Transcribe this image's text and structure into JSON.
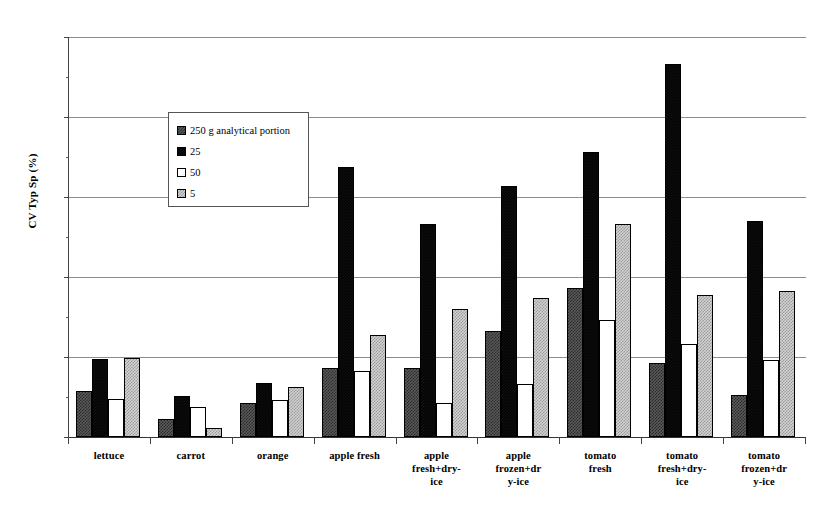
{
  "chart_data": {
    "type": "bar",
    "title": "",
    "subtitle": "",
    "xlabel": "",
    "ylabel": "CV Typ Sp (%)",
    "ylim": [
      0,
      25
    ],
    "ytick_labels": [
      "0",
      "5",
      "10",
      "15",
      "20",
      "25"
    ],
    "ytick_values": [
      0,
      5,
      10,
      15,
      20,
      25
    ],
    "grid": true,
    "legend_position": "upper-left-inside",
    "categories": [
      "lettuce",
      "carrot",
      "orange",
      "apple fresh",
      "apple fresh+dry-ice",
      "apple frozen+dry-ice",
      "tomato fresh",
      "tomato fresh+dry-ice",
      "tomato frozen+dry-ice"
    ],
    "category_label_lines": [
      [
        "lettuce"
      ],
      [
        "carrot"
      ],
      [
        "orange"
      ],
      [
        "apple fresh"
      ],
      [
        "apple",
        "fresh+dry-",
        "ice"
      ],
      [
        "apple",
        "frozen+dr",
        "y-ice"
      ],
      [
        "tomato",
        "fresh"
      ],
      [
        "tomato",
        "fresh+dry-",
        "ice"
      ],
      [
        "tomato",
        "frozen+dr",
        "y-ice"
      ]
    ],
    "series": [
      {
        "name": "250 g analytical portion",
        "color": "#5a5a5a",
        "values": [
          2.9,
          1.1,
          2.1,
          4.3,
          4.3,
          6.6,
          9.3,
          4.6,
          2.6
        ]
      },
      {
        "name": "25",
        "color": "#0d0d0d",
        "values": [
          4.85,
          2.55,
          3.4,
          16.9,
          13.3,
          15.7,
          17.8,
          23.3,
          13.5
        ]
      },
      {
        "name": "50",
        "color": "#ffffff",
        "values": [
          2.35,
          1.85,
          2.3,
          4.1,
          2.1,
          3.3,
          7.3,
          5.8,
          4.8
        ]
      },
      {
        "name": "5",
        "color": "#d2d2d2",
        "values": [
          4.95,
          0.55,
          3.15,
          6.4,
          8.0,
          8.7,
          13.3,
          8.9,
          9.1
        ]
      }
    ]
  },
  "legend": {
    "entries": [
      {
        "label": "250 g analytical portion",
        "swatch": "s1"
      },
      {
        "label": "25",
        "swatch": "s2"
      },
      {
        "label": "50",
        "swatch": "s3"
      },
      {
        "label": "5",
        "swatch": "s4"
      }
    ]
  }
}
